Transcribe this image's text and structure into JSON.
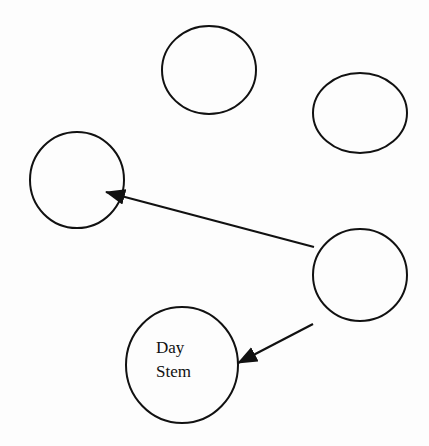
{
  "diagram": {
    "stroke_color": "#111111",
    "background": "#fdfdfd",
    "nodes": [
      {
        "id": "top",
        "label": "",
        "cx": 209,
        "cy": 70,
        "rx": 47,
        "ry": 44
      },
      {
        "id": "top-right",
        "label": "",
        "cx": 360,
        "cy": 113,
        "rx": 47,
        "ry": 40
      },
      {
        "id": "left",
        "label": "",
        "cx": 77,
        "cy": 180,
        "rx": 47,
        "ry": 48
      },
      {
        "id": "right",
        "label": "",
        "cx": 360,
        "cy": 275,
        "rx": 47,
        "ry": 46
      },
      {
        "id": "day-stem",
        "label_line1": "Day",
        "label_line2": "Stem",
        "cx": 182,
        "cy": 365,
        "rx": 56,
        "ry": 58
      }
    ],
    "edges": [
      {
        "from": "right",
        "to": "left",
        "x1": 314,
        "y1": 247,
        "x2": 106,
        "y2": 192
      },
      {
        "from": "right",
        "to": "day-stem",
        "x1": 313,
        "y1": 324,
        "x2": 238,
        "y2": 363
      }
    ]
  }
}
